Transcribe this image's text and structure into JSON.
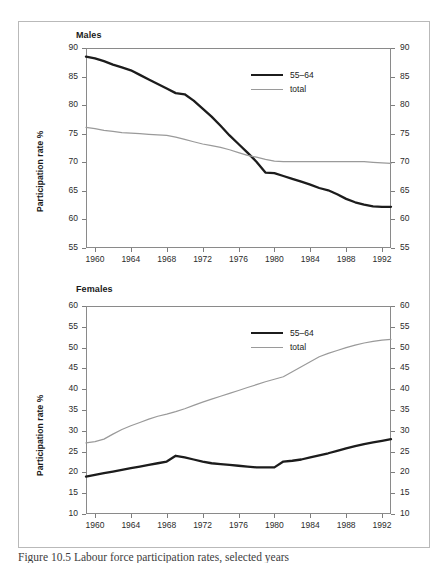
{
  "figure": {
    "caption": "Figure 10.5 Labour force participation rates, selected years"
  },
  "colors": {
    "series_5564": "#1c1c1c",
    "series_total": "#9a9a9a",
    "axis": "#8a8a8a",
    "frame": "#b9b9b9",
    "text": "#1a1a1a"
  },
  "chart_data": [
    {
      "type": "line",
      "title": "Males",
      "xlabel": "",
      "ylabel": "Participation rate %",
      "xlim": [
        1959,
        1993
      ],
      "ylim": [
        55,
        90
      ],
      "yticks": [
        55,
        60,
        65,
        70,
        75,
        80,
        85,
        90
      ],
      "xticks": [
        1960,
        1964,
        1968,
        1972,
        1976,
        1980,
        1984,
        1988,
        1992
      ],
      "grid": false,
      "legend_position": "top-right",
      "dual_axis": true,
      "x": [
        1959,
        1960,
        1961,
        1962,
        1963,
        1964,
        1965,
        1966,
        1967,
        1968,
        1969,
        1970,
        1971,
        1972,
        1973,
        1974,
        1975,
        1976,
        1977,
        1978,
        1979,
        1980,
        1981,
        1982,
        1983,
        1984,
        1985,
        1986,
        1987,
        1988,
        1989,
        1990,
        1991,
        1992,
        1993
      ],
      "series": [
        {
          "name": "55-64",
          "style": "thick-dark",
          "values": [
            88.5,
            88.2,
            87.7,
            87.1,
            86.6,
            86.1,
            85.3,
            84.5,
            83.7,
            82.9,
            82.1,
            81.9,
            80.8,
            79.4,
            78.0,
            76.4,
            74.7,
            73.2,
            71.7,
            70.1,
            68.2,
            68.1,
            67.6,
            67.1,
            66.6,
            66.1,
            65.5,
            65.1,
            64.4,
            63.6,
            63.0,
            62.6,
            62.3,
            62.2,
            62.2
          ]
        },
        {
          "name": "total",
          "style": "thin-gray",
          "values": [
            76.1,
            75.9,
            75.6,
            75.4,
            75.2,
            75.1,
            75.0,
            74.9,
            74.8,
            74.7,
            74.4,
            74.0,
            73.6,
            73.2,
            72.9,
            72.6,
            72.2,
            71.7,
            71.2,
            70.9,
            70.5,
            70.2,
            70.1,
            70.1,
            70.1,
            70.1,
            70.1,
            70.1,
            70.1,
            70.1,
            70.1,
            70.1,
            70.0,
            69.9,
            69.8
          ]
        }
      ]
    },
    {
      "type": "line",
      "title": "Females",
      "xlabel": "",
      "ylabel": "Participation rate %",
      "xlim": [
        1959,
        1993
      ],
      "ylim": [
        10,
        60
      ],
      "yticks": [
        10,
        15,
        20,
        25,
        30,
        35,
        40,
        45,
        50,
        55,
        60
      ],
      "xticks": [
        1960,
        1964,
        1968,
        1972,
        1976,
        1980,
        1984,
        1988,
        1992
      ],
      "grid": false,
      "legend_position": "top-right",
      "dual_axis": true,
      "x": [
        1959,
        1960,
        1961,
        1962,
        1963,
        1964,
        1965,
        1966,
        1967,
        1968,
        1969,
        1970,
        1971,
        1972,
        1973,
        1974,
        1975,
        1976,
        1977,
        1978,
        1979,
        1980,
        1981,
        1982,
        1983,
        1984,
        1985,
        1986,
        1987,
        1988,
        1989,
        1990,
        1991,
        1992,
        1993
      ],
      "series": [
        {
          "name": "55-64",
          "style": "thick-dark",
          "values": [
            19.0,
            19.4,
            19.8,
            20.2,
            20.6,
            21.0,
            21.4,
            21.8,
            22.2,
            22.6,
            24.0,
            23.6,
            23.1,
            22.6,
            22.2,
            22.0,
            21.8,
            21.6,
            21.4,
            21.2,
            21.2,
            21.2,
            22.6,
            22.8,
            23.1,
            23.6,
            24.1,
            24.6,
            25.2,
            25.8,
            26.3,
            26.8,
            27.2,
            27.6,
            28.0
          ]
        },
        {
          "name": "total",
          "style": "thin-gray",
          "values": [
            27.1,
            27.4,
            28.0,
            29.2,
            30.3,
            31.2,
            32.0,
            32.8,
            33.5,
            34.0,
            34.6,
            35.3,
            36.1,
            36.9,
            37.6,
            38.3,
            39.0,
            39.7,
            40.4,
            41.1,
            41.8,
            42.4,
            43.0,
            44.2,
            45.4,
            46.6,
            47.8,
            48.6,
            49.3,
            50.0,
            50.6,
            51.1,
            51.5,
            51.8,
            52.0
          ]
        }
      ]
    }
  ],
  "panels": {
    "males": {
      "title": "Males",
      "ylabel": "Participation rate %",
      "legend": [
        {
          "label": "55–64",
          "style": "thick"
        },
        {
          "label": "total",
          "style": "thin"
        }
      ],
      "yticks": [
        "90",
        "85",
        "80",
        "75",
        "70",
        "65",
        "60",
        "55"
      ],
      "xticks": [
        "1960",
        "1964",
        "1968",
        "1972",
        "1976",
        "1980",
        "1984",
        "1988",
        "1992"
      ]
    },
    "females": {
      "title": "Females",
      "ylabel": "Participation rate %",
      "legend": [
        {
          "label": "55–64",
          "style": "thick"
        },
        {
          "label": "total",
          "style": "thin"
        }
      ],
      "yticks": [
        "60",
        "55",
        "50",
        "45",
        "40",
        "35",
        "30",
        "25",
        "20",
        "15",
        "10"
      ],
      "xticks": [
        "1960",
        "1964",
        "1968",
        "1972",
        "1976",
        "1980",
        "1984",
        "1988",
        "1992"
      ]
    }
  }
}
